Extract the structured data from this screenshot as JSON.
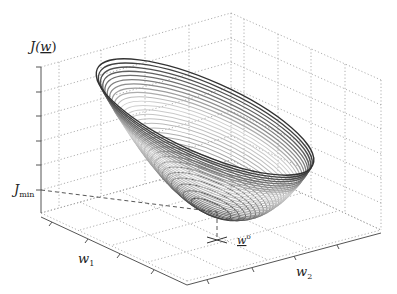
{
  "chart_data": {
    "type": "surface-contour-3d",
    "title": "",
    "zlabel": "J(w)",
    "xlabel": "w1",
    "ylabel": "w2",
    "annotations": [
      {
        "text": "J_min",
        "position": "z-axis level of bowl minimum"
      },
      {
        "text": "w°",
        "position": "optimal weight vector projected on w1-w2 plane"
      }
    ],
    "z_ticks": 6,
    "w1_ticks": 4,
    "w2_ticks": 4,
    "grid": true,
    "surface": "quadratic bowl (elliptic paraboloid) drawn as stacked elliptical level contours, darker toward top and bottom, lighter in middle",
    "contour_count": 30
  },
  "labels": {
    "z_axis": "J(",
    "z_axis_arg": "w",
    "z_axis_close": ")",
    "jmin_main": "J",
    "jmin_sub": "min",
    "w1_main": "w",
    "w1_sub": "1",
    "w2_main": "w",
    "w2_sub": "2",
    "wopt_main": "w",
    "wopt_sup": "o"
  },
  "colors": {
    "grid": "#9a9a9a",
    "axis": "#555555",
    "contour_dark": "#333333",
    "contour_light": "#d0d0d0"
  }
}
